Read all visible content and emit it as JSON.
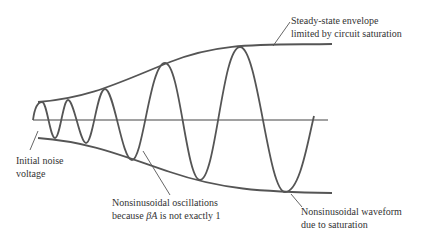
{
  "diagram": {
    "colors": {
      "curve": "#555555",
      "axis": "#444444",
      "text": "#333333",
      "background": "#ffffff"
    },
    "elements": {
      "time_axis": {
        "x1": 33,
        "y": 120,
        "x2": 328
      },
      "upper_envelope": "M 38 102 C 90 98, 120 82, 170 62 S 260 45, 332 44",
      "lower_envelope": "M 38 138 C 90 142, 120 155, 170 172 S 260 192, 332 193",
      "waveform": "M 33 120 C 35 105, 39 102, 42 102 C 47 102, 50 138, 55 138 C 60 138, 63 100, 68 100 C 74 100, 80 143, 86 143 C 93 143, 97 89, 105 89 C 114 89, 122 160, 132 160 C 143 160, 150 63, 165 63 C 180 63, 186 180, 200 180 C 216 180, 222 47, 240 47 C 258 47, 268 192, 285 192 C 300 192, 308 140, 314 116",
      "leaders": [
        {
          "name": "envelope-leader",
          "x1": 290,
          "y1": 22,
          "x2": 273,
          "y2": 46
        },
        {
          "name": "noise-leader",
          "x1": 38,
          "y1": 131,
          "x2": 30,
          "y2": 150
        },
        {
          "name": "nonsinusoidal-osc-leader",
          "x1": 143,
          "y1": 151,
          "x2": 170,
          "y2": 195
        },
        {
          "name": "nonsinusoidal-wave-leader",
          "x1": 291,
          "y1": 194,
          "x2": 302,
          "y2": 207
        }
      ]
    },
    "labels": {
      "envelope": {
        "line1": "Steady-state envelope",
        "line2": "limited by circuit saturation"
      },
      "noise": {
        "line1": "Initial noise",
        "line2": "voltage"
      },
      "nonsinusoidal_osc": {
        "line1": "Nonsinusoidal oscillations",
        "line2_pre": "because ",
        "line2_sym": "βA",
        "line2_post": " is not exactly 1"
      },
      "nonsinusoidal_wave": {
        "line1": "Nonsinusoidal waveform",
        "line2": "due to saturation"
      }
    }
  }
}
